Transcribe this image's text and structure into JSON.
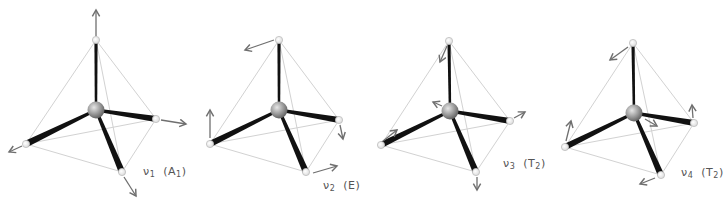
{
  "figure": {
    "colors": {
      "edge": "#d2d2d2",
      "bond": "#111111",
      "arrow": "#6f6f6f",
      "sphere_light": "#d8d8d8",
      "sphere_dark": "#6a6a6a",
      "label": "#555555"
    },
    "modes": [
      {
        "id": "v1",
        "symbol": "ν",
        "index": "1",
        "symmetry_main": "A",
        "symmetry_sub": "1",
        "label_text": "ν1 (A1)",
        "center": [
          96,
          110
        ],
        "vertices": {
          "top": [
            96,
            40
          ],
          "left": [
            26,
            144
          ],
          "right": [
            156,
            119
          ],
          "bottom": [
            122,
            172
          ]
        },
        "arrows": [
          {
            "from": [
              96,
              36
            ],
            "to": [
              96,
              10
            ]
          },
          {
            "from": [
              22,
              146
            ],
            "to": [
              9,
              152
            ]
          },
          {
            "from": [
              161,
              120
            ],
            "to": [
              186,
              124
            ]
          },
          {
            "from": [
              124,
              177
            ],
            "to": [
              136,
              196
            ]
          }
        ],
        "label_pos": [
          143,
          165
        ]
      },
      {
        "id": "v2",
        "symbol": "ν",
        "index": "2",
        "symmetry_main": "E",
        "symmetry_sub": "",
        "label_text": "ν2 (E)",
        "center": [
          279,
          110
        ],
        "vertices": {
          "top": [
            279,
            40
          ],
          "left": [
            210,
            144
          ],
          "right": [
            339,
            120
          ],
          "bottom": [
            306,
            172
          ]
        },
        "arrows": [
          {
            "from": [
              274,
              40
            ],
            "to": [
              245,
              50
            ]
          },
          {
            "from": [
              210,
              138
            ],
            "to": [
              210,
              110
            ]
          },
          {
            "from": [
              340,
              125
            ],
            "to": [
              343,
              139
            ]
          },
          {
            "from": [
              313,
              173
            ],
            "to": [
              337,
              166
            ]
          }
        ],
        "label_pos": [
          323,
          179
        ]
      },
      {
        "id": "v3",
        "symbol": "ν",
        "index": "3",
        "symmetry_main": "T",
        "symmetry_sub": "2",
        "label_text": "ν3 (T2)",
        "center": [
          450,
          111
        ],
        "vertices": {
          "top": [
            449,
            41
          ],
          "left": [
            381,
            145
          ],
          "right": [
            510,
            121
          ],
          "bottom": [
            476,
            172
          ]
        },
        "arrows": [
          {
            "from": [
              447,
              46
            ],
            "to": [
              440,
              62
            ]
          },
          {
            "from": [
              442,
              106
            ],
            "to": [
              433,
              102
            ]
          },
          {
            "from": [
              383,
              141
            ],
            "to": [
              397,
              130
            ]
          },
          {
            "from": [
              514,
              118
            ],
            "to": [
              525,
              112
            ]
          },
          {
            "from": [
              477,
              177
            ],
            "to": [
              477,
              190
            ]
          }
        ],
        "label_pos": [
          503,
          157
        ]
      },
      {
        "id": "v4",
        "symbol": "ν",
        "index": "4",
        "symmetry_main": "T",
        "symmetry_sub": "2",
        "label_text": "ν4 (T2)",
        "center": [
          634,
          113
        ],
        "vertices": {
          "top": [
            633,
            43
          ],
          "left": [
            565,
            147
          ],
          "right": [
            694,
            123
          ],
          "bottom": [
            661,
            175
          ]
        },
        "arrows": [
          {
            "from": [
              628,
              47
            ],
            "to": [
              610,
              60
            ]
          },
          {
            "from": [
              645,
              119
            ],
            "to": [
              657,
              126
            ]
          },
          {
            "from": [
              566,
              141
            ],
            "to": [
              571,
              121
            ]
          },
          {
            "from": [
              693,
              118
            ],
            "to": [
              692,
              105
            ]
          },
          {
            "from": [
              655,
              178
            ],
            "to": [
              640,
              184
            ]
          }
        ],
        "label_pos": [
          681,
          166
        ]
      }
    ]
  }
}
